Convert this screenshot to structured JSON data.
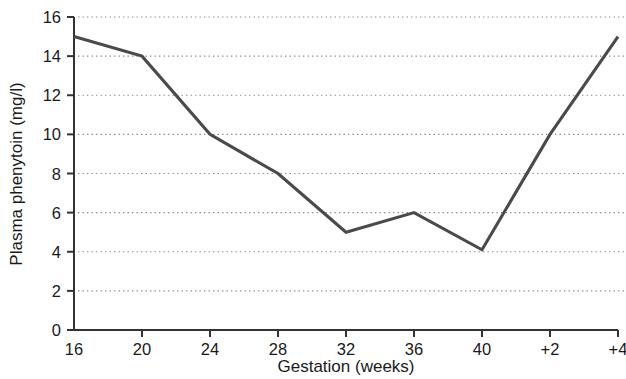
{
  "chart_data": {
    "type": "line",
    "title": "",
    "xlabel": "Gestation (weeks)",
    "ylabel": "Plasma phenytoin (mg/l)",
    "categories": [
      "16",
      "20",
      "24",
      "28",
      "32",
      "36",
      "40",
      "+2",
      "+4"
    ],
    "x_tick_labels": [
      "16",
      "20",
      "24",
      "28",
      "32",
      "36",
      "40",
      "+2",
      "+4"
    ],
    "y_tick_labels": [
      "0",
      "2",
      "4",
      "6",
      "8",
      "10",
      "12",
      "14",
      "16"
    ],
    "y_ticks": [
      0,
      2,
      4,
      6,
      8,
      10,
      12,
      14,
      16
    ],
    "ylim": [
      0,
      16
    ],
    "grid": "horizontal-dotted",
    "legend": "none",
    "series": [
      {
        "name": "Plasma phenytoin",
        "color": "#4a4a4a",
        "values": [
          15.0,
          14.0,
          10.0,
          8.0,
          5.0,
          6.0,
          4.1,
          10.0,
          15.0
        ]
      }
    ]
  },
  "axes": {
    "line_color": "#333333",
    "grid_color": "#8a8a8a"
  }
}
